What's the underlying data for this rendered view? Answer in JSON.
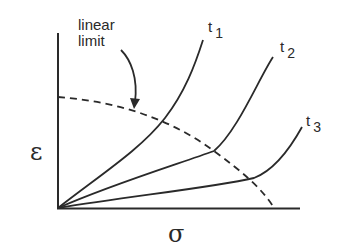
{
  "diagram": {
    "type": "strain-vs-stress isochronous curves",
    "axes": {
      "x_label": "σ",
      "y_label": "ε"
    },
    "annotation": {
      "line1": "linear",
      "line2": "limit"
    },
    "curves": [
      {
        "name": "t",
        "subscript": "1"
      },
      {
        "name": "t",
        "subscript": "2"
      },
      {
        "name": "t",
        "subscript": "3"
      }
    ],
    "colors": {
      "ink": "#2a2a2a",
      "background": "#ffffff"
    }
  }
}
